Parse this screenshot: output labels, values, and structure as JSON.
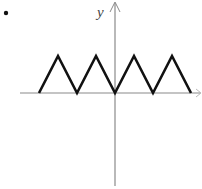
{
  "chart_data": {
    "type": "line",
    "title": "",
    "xlabel": "x",
    "ylabel": "y",
    "x": [
      -4,
      -3,
      -2,
      -1,
      0,
      1,
      2,
      3,
      4
    ],
    "series": [
      {
        "name": "f(x)",
        "values": [
          0,
          1,
          0,
          1,
          0,
          1,
          0,
          1,
          0
        ]
      }
    ],
    "grid": false,
    "legend": null
  },
  "labels": {
    "bullet": "•",
    "y_axis": "y",
    "x_axis": "x"
  },
  "colors": {
    "axis": "#8a8a8a",
    "curve": "#111111"
  }
}
